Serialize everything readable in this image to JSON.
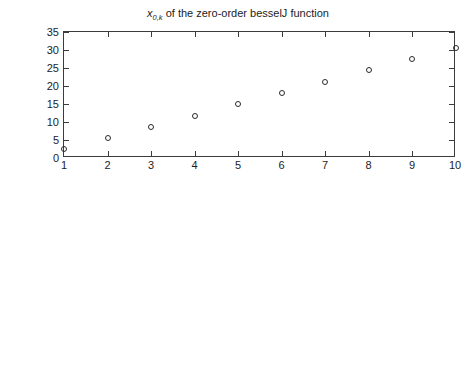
{
  "figure": {
    "width": 476,
    "height": 378,
    "background": "#ffffff",
    "axis_color": "#3c3c3c",
    "marker_color": "#2b2b2b"
  },
  "panels": {
    "top": {
      "title_plain": "x0,k of the zero-order besselJ function",
      "title_prefix_var": "x",
      "title_subscript": "0,k",
      "title_rest": " of the zero-order besselJ function",
      "ylabel": "",
      "xlabel": "",
      "yticks": [
        "0",
        "5",
        "10",
        "15",
        "20",
        "25",
        "30",
        "35"
      ],
      "xticks": [
        "1",
        "2",
        "3",
        "4",
        "5",
        "6",
        "7",
        "8",
        "9",
        "10"
      ]
    },
    "bottom": {
      "title": "Error in approximate values of the zeros",
      "xlabel": "k",
      "yticks": [
        "−10−15",
        "−10−10",
        "−10−15",
        "−100"
      ],
      "ytick_parts": [
        {
          "base": "−10",
          "exp": "−15"
        },
        {
          "base": "−10",
          "exp": "−10"
        },
        {
          "base": "−10",
          "exp": "−15"
        },
        {
          "base": "−10",
          "exp": "0"
        }
      ],
      "xticks": [
        "1",
        "2",
        "3",
        "4",
        "5",
        "6",
        "7",
        "8",
        "9",
        "10"
      ]
    }
  },
  "chart_data": [
    {
      "type": "scatter",
      "title": "x_{0,k} of the zero-order besselJ function",
      "xlabel": "",
      "ylabel": "",
      "xlim": [
        1,
        10
      ],
      "ylim": [
        0,
        35
      ],
      "xticks": [
        1,
        2,
        3,
        4,
        5,
        6,
        7,
        8,
        9,
        10
      ],
      "yticks": [
        0,
        5,
        10,
        15,
        20,
        25,
        30,
        35
      ],
      "grid": false,
      "legend": false,
      "marker": "open-circle",
      "series": [
        {
          "name": "zeros of J0",
          "x": [
            1,
            2,
            3,
            4,
            5,
            6,
            7,
            8,
            9,
            10
          ],
          "values": [
            2.4,
            5.52,
            8.65,
            11.79,
            14.93,
            18.07,
            21.21,
            24.35,
            27.49,
            30.63
          ]
        }
      ]
    },
    {
      "type": "scatter",
      "title": "Error in approximate values of the zeros",
      "xlabel": "k",
      "ylabel": "",
      "yscale": "negative-log-reversed",
      "xlim": [
        1,
        10
      ],
      "ylim_exponents": [
        -15,
        0
      ],
      "xticks": [
        1,
        2,
        3,
        4,
        5,
        6,
        7,
        8,
        9,
        10
      ],
      "ytick_labels": [
        "-10^-15",
        "-10^-10",
        "-10^-15",
        "-10^0"
      ],
      "ytick_positions_fraction": [
        0.0,
        0.4286,
        0.7937,
        1.0
      ],
      "grid": false,
      "legend": false,
      "marker": "open-circle",
      "series": [
        {
          "name": "error",
          "x": [
            1,
            2,
            3,
            4,
            5,
            6,
            7,
            8,
            9,
            10
          ],
          "values_fraction": [
            0.79,
            0.695,
            0.643,
            0.603,
            0.578,
            0.556,
            0.537,
            0.522,
            0.508,
            0.494
          ],
          "values_exponent": [
            -13.3,
            -13.8,
            -14.0,
            -14.2,
            -14.3,
            -14.4,
            -14.5,
            -14.6,
            -14.6,
            -14.7
          ]
        }
      ]
    }
  ]
}
